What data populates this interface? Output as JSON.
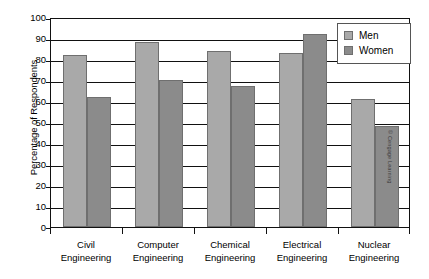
{
  "chart_data": {
    "type": "bar",
    "title": "",
    "subtitle": "",
    "xlabel": "",
    "ylabel": "Percentage of Respondents",
    "categories": [
      "Civil Engineering",
      "Computer Engineering",
      "Chemical Engineering",
      "Electrical Engineering",
      "Nuclear Engineering"
    ],
    "category_lines": [
      [
        "Civil",
        "Engineering"
      ],
      [
        "Computer",
        "Engineering"
      ],
      [
        "Chemical",
        "Engineering"
      ],
      [
        "Electrical",
        "Engineering"
      ],
      [
        "Nuclear",
        "Engineering"
      ]
    ],
    "series": [
      {
        "name": "Men",
        "color": "#a9a9a9",
        "values": [
          82,
          88,
          84,
          83,
          61
        ]
      },
      {
        "name": "Women",
        "color": "#8b8b8b",
        "values": [
          62,
          70,
          67,
          92,
          48
        ]
      }
    ],
    "ylim": [
      0,
      100
    ],
    "ytick_step": 10,
    "yticks": [
      100,
      90,
      80,
      70,
      60,
      50,
      40,
      30,
      20,
      10,
      0
    ],
    "grid": true,
    "legend_position": "top-right"
  },
  "legend": {
    "entries": [
      {
        "label": "Men"
      },
      {
        "label": "Women"
      }
    ]
  },
  "credit": {
    "text": "© Cengage Learning"
  }
}
